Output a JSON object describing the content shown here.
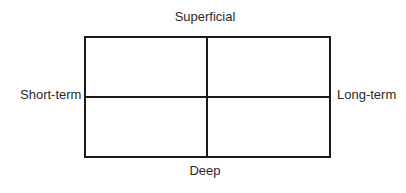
{
  "diagram": {
    "type": "quadrant-matrix",
    "axes": {
      "vertical": {
        "top": "Superficial",
        "bottom": "Deep"
      },
      "horizontal": {
        "left": "Short-term",
        "right": "Long-term"
      }
    },
    "quadrants": [
      {
        "position": "top-left",
        "label": ""
      },
      {
        "position": "top-right",
        "label": ""
      },
      {
        "position": "bottom-left",
        "label": ""
      },
      {
        "position": "bottom-right",
        "label": ""
      }
    ],
    "colors": {
      "line": "#1a1a1a",
      "text": "#2b2b2b",
      "background": "#ffffff"
    }
  }
}
